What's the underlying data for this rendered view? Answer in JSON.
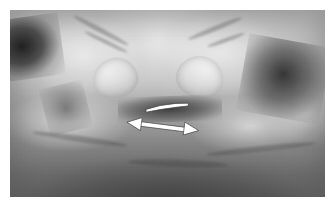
{
  "figure": {
    "kind": "clinical-photograph",
    "color_mode": "grayscale",
    "page_background": "#ffffff",
    "photo": {
      "x": 10,
      "y": 10,
      "width": 315,
      "height": 187,
      "tone_range": {
        "darkest": "#161616",
        "midtone": "#9c9c9c",
        "lightest": "#f2f2f2"
      }
    },
    "caption": "",
    "label": ""
  },
  "annotations": [
    {
      "id": "measurement-bar",
      "type": "bar",
      "shape": "tapered-white-bar",
      "color": "#ffffff",
      "outline_color": "#3c3c3c",
      "label": "",
      "geometry": {
        "x1": 136,
        "y1": 97,
        "x2": 178,
        "y2": 94,
        "thickness": 4.6
      }
    },
    {
      "id": "measurement-arrow",
      "type": "double-headed-arrow",
      "shape": "double-arrow",
      "color": "#ffffff",
      "outline_color": "#3c3c3c",
      "label": "",
      "geometry": {
        "x1": 119,
        "y1": 112,
        "x2": 185,
        "y2": 120,
        "thickness": 5.2,
        "head_length": 13,
        "head_width": 13
      }
    }
  ],
  "anatomy_regions": [
    {
      "name": "left-thumb",
      "description": "upper-left thumb with visible nail"
    },
    {
      "name": "right-thumb",
      "description": "upper-right thumb with visible nail"
    },
    {
      "name": "left-index-finger",
      "description": "lower-left index finger pad"
    },
    {
      "name": "right-index-finger",
      "description": "lower-right index finger pad"
    },
    {
      "name": "right-knuckle",
      "description": "far-right knuckle / proximal phalanx"
    },
    {
      "name": "shadow-upper-left",
      "description": "dark background wedge, upper left corner"
    },
    {
      "name": "shadow-center-gap",
      "description": "dark gap between the opposing thumb tips"
    },
    {
      "name": "shadow-right-cleft",
      "description": "dark cleft between right thumb and knuckle"
    },
    {
      "name": "shadow-foreground",
      "description": "dark out-of-focus foreground across the lower frame"
    }
  ]
}
